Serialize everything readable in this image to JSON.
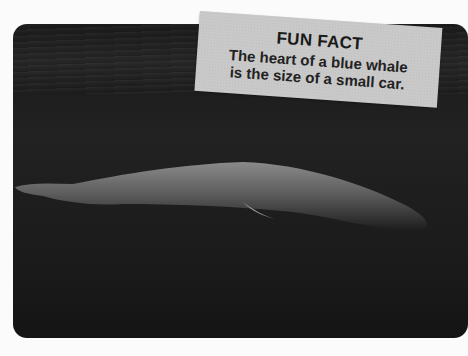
{
  "photo": {
    "subject": "whale-underwater",
    "background_color": "#1e1e1e"
  },
  "fun_fact": {
    "title": "FUN FACT",
    "line1": "The heart of a blue whale",
    "line2": "is the size of a small car."
  }
}
